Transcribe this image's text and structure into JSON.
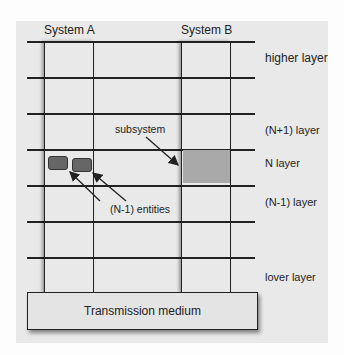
{
  "systems": [
    {
      "label": "System A"
    },
    {
      "label": "System B"
    }
  ],
  "layers": [
    {
      "label": "higher layer"
    },
    {
      "label": "(N+1) layer"
    },
    {
      "label": "N layer"
    },
    {
      "label": "(N-1) layer"
    },
    {
      "label": "lover layer"
    }
  ],
  "annotations": {
    "subsystem": "subsystem",
    "entities": "(N-1) entities"
  },
  "base": {
    "label": "Transmission medium"
  },
  "colors": {
    "background": "#e9e9e9",
    "subsystem_fill": "#a9a9a9",
    "entity_fill": "#666666",
    "line": "#222222"
  }
}
